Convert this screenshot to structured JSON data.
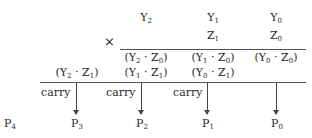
{
  "diagram": {
    "multiplicand": [
      {
        "base": "Y",
        "sub": "2"
      },
      {
        "base": "Y",
        "sub": "1"
      },
      {
        "base": "Y",
        "sub": "0"
      }
    ],
    "multiplier": [
      {
        "base": "Z",
        "sub": "1"
      },
      {
        "base": "Z",
        "sub": "0"
      }
    ],
    "operator": "×",
    "partial_products_row1": [
      {
        "text": "(Y",
        "s1": "2",
        "mid": " · Z",
        "s2": "0",
        "end": ")"
      },
      {
        "text": "(Y",
        "s1": "1",
        "mid": " · Z",
        "s2": "0",
        "end": ")"
      },
      {
        "text": "(Y",
        "s1": "0",
        "mid": " · Z",
        "s2": "0",
        "end": ")"
      }
    ],
    "partial_products_row2": [
      {
        "text": "(Y",
        "s1": "2",
        "mid": " · Z",
        "s2": "1",
        "end": ")"
      },
      {
        "text": "(Y",
        "s1": "1",
        "mid": " · Z",
        "s2": "1",
        "end": ")"
      },
      {
        "text": "(Y",
        "s1": "0",
        "mid": " · Z",
        "s2": "1",
        "end": ")"
      }
    ],
    "carry_label": "carry",
    "results": [
      {
        "base": "P",
        "sub": "4"
      },
      {
        "base": "P",
        "sub": "3"
      },
      {
        "base": "P",
        "sub": "2"
      },
      {
        "base": "P",
        "sub": "1"
      },
      {
        "base": "P",
        "sub": "0"
      }
    ]
  }
}
